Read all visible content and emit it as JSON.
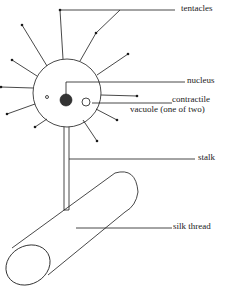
{
  "diagram": {
    "labels": {
      "tentacles": "tentacles",
      "nucleus": "nucleus",
      "contractile_line1": "contractile",
      "contractile_line2": "vacuole (one of two)",
      "stalk": "stalk",
      "silk_thread": "silk thread"
    },
    "colors": {
      "stroke": "#1a1a1a",
      "nucleus_fill": "#333333",
      "background": "#ffffff"
    }
  }
}
